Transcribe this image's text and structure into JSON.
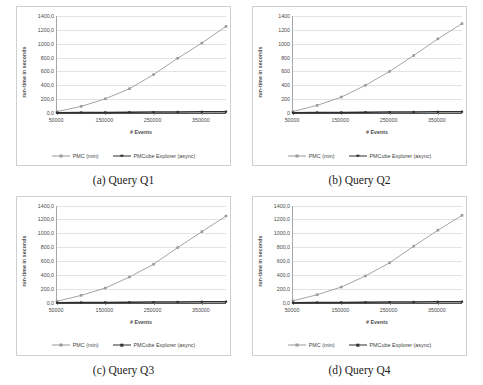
{
  "figure": {
    "subfigures": [
      {
        "caption": "(a) Query Q1",
        "chart_index": 0
      },
      {
        "caption": "(b) Query Q2",
        "chart_index": 1
      },
      {
        "caption": "(c) Query Q3",
        "chart_index": 2
      },
      {
        "caption": "(d) Query Q4",
        "chart_index": 3
      }
    ],
    "legend": {
      "entries": [
        {
          "label": "PMC (min)",
          "color": "#9a9a9a"
        },
        {
          "label": "PMCube Explorer (async)",
          "color": "#2f2f2f"
        }
      ]
    }
  },
  "chart_data": [
    {
      "type": "line",
      "title": "(a) Query Q1",
      "xlabel": "# Events",
      "ylabel": "run-time in seconds",
      "x": [
        50000,
        100000,
        150000,
        200000,
        250000,
        300000,
        350000,
        400000
      ],
      "xlim": [
        50000,
        400000
      ],
      "ylim": [
        0,
        1400
      ],
      "yticks": [
        0,
        200,
        400,
        600,
        800,
        1000,
        1200,
        1400
      ],
      "ytick_labels": [
        "0,0",
        "200,0",
        "400,0",
        "600,0",
        "800,0",
        "1000,0",
        "1200,0",
        "1400,0"
      ],
      "xticks": [
        50000,
        150000,
        250000,
        350000
      ],
      "xtick_labels": [
        "50000",
        "150000",
        "250000",
        "350000"
      ],
      "grid": true,
      "legend_position": "bottom",
      "series": [
        {
          "name": "PMC (min)",
          "color": "#9a9a9a",
          "marker": "square",
          "values": [
            20,
            95,
            205,
            350,
            555,
            790,
            1010,
            1250
          ]
        },
        {
          "name": "PMCube Explorer (async)",
          "color": "#2f2f2f",
          "marker": "square",
          "values": [
            5,
            7,
            9,
            11,
            13,
            15,
            17,
            19
          ]
        }
      ]
    },
    {
      "type": "line",
      "title": "(b) Query Q2",
      "xlabel": "# Events",
      "ylabel": "run-time in seconds",
      "x": [
        50000,
        100000,
        150000,
        200000,
        250000,
        300000,
        350000,
        400000
      ],
      "xlim": [
        50000,
        400000
      ],
      "ylim": [
        0,
        1400
      ],
      "yticks": [
        0,
        200,
        400,
        600,
        800,
        1000,
        1200,
        1400
      ],
      "ytick_labels": [
        "0",
        "200",
        "400",
        "600",
        "800",
        "1000",
        "1200",
        "1400"
      ],
      "xticks": [
        50000,
        150000,
        250000,
        350000
      ],
      "xtick_labels": [
        "50000",
        "150000",
        "250000",
        "350000"
      ],
      "grid": true,
      "legend_position": "bottom",
      "series": [
        {
          "name": "PMC (min)",
          "color": "#9a9a9a",
          "marker": "square",
          "values": [
            20,
            110,
            230,
            400,
            600,
            830,
            1070,
            1290
          ]
        },
        {
          "name": "PMCube Explorer (async)",
          "color": "#2f2f2f",
          "marker": "square",
          "values": [
            5,
            7,
            9,
            11,
            13,
            15,
            17,
            19
          ]
        }
      ]
    },
    {
      "type": "line",
      "title": "(c) Query Q3",
      "xlabel": "# Events",
      "ylabel": "run-time in seconds",
      "x": [
        50000,
        100000,
        150000,
        200000,
        250000,
        300000,
        350000,
        400000
      ],
      "xlim": [
        50000,
        400000
      ],
      "ylim": [
        0,
        1400
      ],
      "yticks": [
        0,
        200,
        400,
        600,
        800,
        1000,
        1200,
        1400
      ],
      "ytick_labels": [
        "0,0",
        "200,0",
        "400,0",
        "600,0",
        "800,0",
        "1000,0",
        "1200,0",
        "1400,0"
      ],
      "xticks": [
        50000,
        150000,
        250000,
        350000
      ],
      "xtick_labels": [
        "50000",
        "150000",
        "250000",
        "350000"
      ],
      "grid": true,
      "legend_position": "bottom",
      "series": [
        {
          "name": "PMC (min)",
          "color": "#9a9a9a",
          "marker": "square",
          "values": [
            25,
            110,
            215,
            375,
            560,
            800,
            1030,
            1255
          ]
        },
        {
          "name": "PMCube Explorer (async)",
          "color": "#2f2f2f",
          "marker": "square",
          "values": [
            5,
            7,
            9,
            11,
            13,
            15,
            17,
            19
          ]
        }
      ]
    },
    {
      "type": "line",
      "title": "(d) Query Q4",
      "xlabel": "# Events",
      "ylabel": "run-time in seconds",
      "x": [
        50000,
        100000,
        150000,
        200000,
        250000,
        300000,
        350000,
        400000
      ],
      "xlim": [
        50000,
        400000
      ],
      "ylim": [
        0,
        1400
      ],
      "yticks": [
        0,
        200,
        400,
        600,
        800,
        1000,
        1200,
        1400
      ],
      "ytick_labels": [
        "0,0",
        "200,0",
        "400,0",
        "600,0",
        "800,0",
        "1000,0",
        "1200,0",
        "1400,0"
      ],
      "xticks": [
        50000,
        150000,
        250000,
        350000
      ],
      "xtick_labels": [
        "50000",
        "150000",
        "250000",
        "350000"
      ],
      "grid": true,
      "legend_position": "bottom",
      "series": [
        {
          "name": "PMC (min)",
          "color": "#9a9a9a",
          "marker": "square",
          "values": [
            30,
            120,
            230,
            390,
            580,
            820,
            1050,
            1265
          ]
        },
        {
          "name": "PMCube Explorer (async)",
          "color": "#2f2f2f",
          "marker": "square",
          "values": [
            5,
            7,
            9,
            11,
            13,
            15,
            17,
            19
          ]
        }
      ]
    }
  ]
}
